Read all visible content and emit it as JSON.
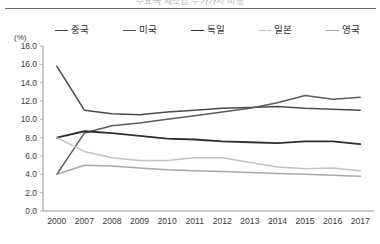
{
  "figure": {
    "title_cut_off": "주요국 제조업 부가가치 비중",
    "axis_unit": "(%)"
  },
  "chart_data": {
    "type": "line",
    "title": "",
    "xlabel": "",
    "ylabel": "(%)",
    "ylim": [
      0.0,
      18.0
    ],
    "ytick_step": 2.0,
    "grid": false,
    "legend_position": "top",
    "categories": [
      "2000",
      "2007",
      "2008",
      "2009",
      "2010",
      "2011",
      "2012",
      "2013",
      "2014",
      "2015",
      "2016",
      "2017"
    ],
    "yticks": [
      "0.0",
      "2.0",
      "4.0",
      "6.0",
      "8.0",
      "10.0",
      "12.0",
      "14.0",
      "16.0",
      "18.0"
    ],
    "series": [
      {
        "name": "중국",
        "color": "#4a4a4d",
        "width": 1.5,
        "values": [
          15.8,
          11.0,
          10.6,
          10.5,
          10.8,
          11.0,
          11.2,
          11.3,
          11.4,
          11.2,
          11.1,
          11.0
        ]
      },
      {
        "name": "미국",
        "color": "#5b5b5e",
        "width": 1.5,
        "values": [
          4.0,
          8.5,
          9.3,
          9.6,
          10.0,
          10.4,
          10.8,
          11.2,
          11.8,
          12.6,
          12.2,
          12.4
        ]
      },
      {
        "name": "독일",
        "color": "#2e2e31",
        "width": 1.9,
        "values": [
          8.0,
          8.7,
          8.5,
          8.2,
          7.9,
          7.8,
          7.6,
          7.5,
          7.4,
          7.6,
          7.6,
          7.3
        ]
      },
      {
        "name": "일본",
        "color": "#c2c2c4",
        "width": 1.5,
        "values": [
          8.0,
          6.5,
          5.8,
          5.5,
          5.5,
          5.8,
          5.8,
          5.3,
          4.8,
          4.6,
          4.7,
          4.4
        ]
      },
      {
        "name": "영국",
        "color": "#a9a9ab",
        "width": 1.5,
        "values": [
          4.0,
          5.0,
          4.9,
          4.7,
          4.5,
          4.4,
          4.3,
          4.2,
          4.1,
          4.0,
          3.9,
          3.8
        ]
      }
    ]
  }
}
